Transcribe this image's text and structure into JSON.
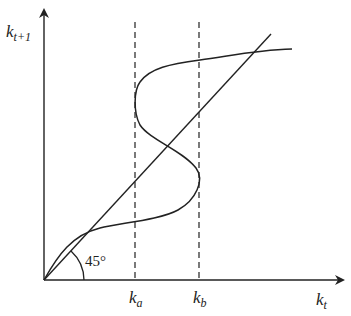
{
  "diagram": {
    "type": "phase-diagram",
    "axes": {
      "y_label": {
        "base": "k",
        "sub": "t+1"
      },
      "x_label": {
        "base": "k",
        "sub": "t"
      }
    },
    "reference_line": {
      "label": "45°",
      "description": "45-degree line k_{t+1} = k_t"
    },
    "markers": [
      {
        "base": "k",
        "sub": "a",
        "style": "dashed"
      },
      {
        "base": "k",
        "sub": "b",
        "style": "dashed"
      }
    ],
    "curve": {
      "description": "S-shaped backward-bending law of motion crossing the 45° line multiple times"
    },
    "colors": {
      "ink": "#222222",
      "background": "#ffffff"
    }
  }
}
